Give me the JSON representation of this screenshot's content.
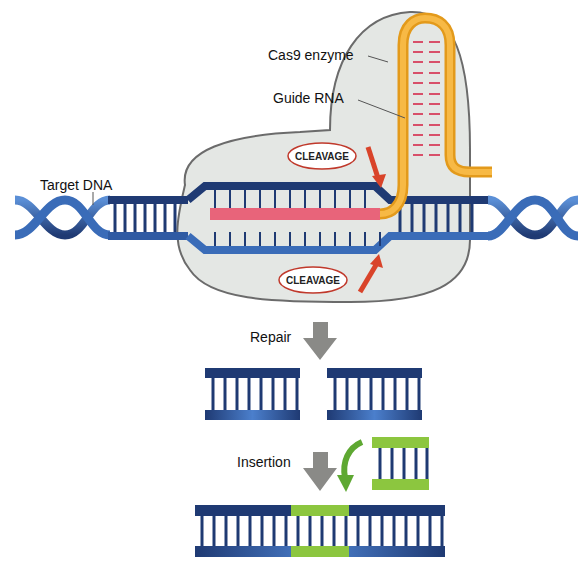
{
  "labels": {
    "cas9": "Cas9 enzyme",
    "guide_rna": "Guide RNA",
    "target_dna": "Target DNA",
    "cleavage_top": "CLEAVAGE",
    "cleavage_bottom": "CLEAVAGE",
    "repair": "Repair",
    "insertion": "Insertion"
  },
  "colors": {
    "dna_dark": "#1f3a73",
    "dna_light": "#3a6cb8",
    "guide_rna": "#f5a623",
    "rna_pink": "#e8647a",
    "enzyme_fill": "#e4e7e4",
    "enzyme_stroke": "#6b6b6b",
    "arrow_red": "#d9442a",
    "arrow_gray": "#8a8a87",
    "insert_green": "#8cc63f"
  }
}
